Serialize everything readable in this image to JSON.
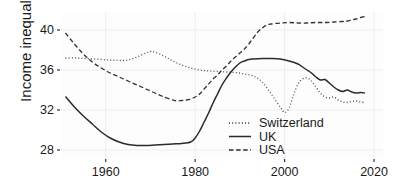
{
  "chart_data": {
    "type": "line",
    "title": "",
    "xlabel": "",
    "ylabel": "Income inequality",
    "xlim": [
      1950,
      2022
    ],
    "ylim": [
      27.2,
      41.8
    ],
    "xticks": [
      1960,
      1980,
      2000,
      2020
    ],
    "xticklabels": [
      "1960",
      "1980",
      "2000",
      "2020"
    ],
    "yticks": [
      28,
      32,
      36,
      40
    ],
    "yticklabels": [
      "28",
      "32",
      "36",
      "40"
    ],
    "grid": true,
    "legend_position": "inside-bottom-right",
    "series": [
      {
        "name": "Switzerland",
        "style": "dotted",
        "color": "#4d4d4d",
        "points": [
          [
            1951,
            37.2
          ],
          [
            1953,
            37.2
          ],
          [
            1955,
            37.15
          ],
          [
            1957,
            37.1
          ],
          [
            1959,
            37.05
          ],
          [
            1961,
            37.0
          ],
          [
            1963,
            36.95
          ],
          [
            1965,
            37.0
          ],
          [
            1967,
            37.3
          ],
          [
            1969,
            37.7
          ],
          [
            1970,
            37.85
          ],
          [
            1971,
            37.8
          ],
          [
            1973,
            37.4
          ],
          [
            1975,
            36.9
          ],
          [
            1977,
            36.5
          ],
          [
            1979,
            36.2
          ],
          [
            1981,
            36.0
          ],
          [
            1983,
            35.9
          ],
          [
            1985,
            35.85
          ],
          [
            1987,
            35.8
          ],
          [
            1989,
            35.75
          ],
          [
            1991,
            35.6
          ],
          [
            1993,
            35.4
          ],
          [
            1995,
            34.8
          ],
          [
            1997,
            33.6
          ],
          [
            1999,
            32.3
          ],
          [
            2000,
            31.75
          ],
          [
            2001,
            32.2
          ],
          [
            2002,
            33.5
          ],
          [
            2003,
            34.6
          ],
          [
            2004,
            35.1
          ],
          [
            2005,
            35.2
          ],
          [
            2006,
            34.9
          ],
          [
            2007,
            34.3
          ],
          [
            2008,
            33.7
          ],
          [
            2009,
            33.3
          ],
          [
            2010,
            33.2
          ],
          [
            2011,
            33.3
          ],
          [
            2012,
            33.0
          ],
          [
            2013,
            32.8
          ],
          [
            2014,
            32.75
          ],
          [
            2015,
            32.85
          ],
          [
            2016,
            32.9
          ],
          [
            2017,
            32.8
          ],
          [
            2018,
            32.75
          ]
        ]
      },
      {
        "name": "UK",
        "style": "solid",
        "color": "#2b2b2b",
        "points": [
          [
            1951,
            33.35
          ],
          [
            1953,
            32.3
          ],
          [
            1955,
            31.4
          ],
          [
            1957,
            30.6
          ],
          [
            1959,
            29.8
          ],
          [
            1961,
            29.2
          ],
          [
            1963,
            28.8
          ],
          [
            1965,
            28.55
          ],
          [
            1967,
            28.45
          ],
          [
            1969,
            28.45
          ],
          [
            1971,
            28.5
          ],
          [
            1973,
            28.55
          ],
          [
            1975,
            28.6
          ],
          [
            1977,
            28.65
          ],
          [
            1979,
            28.8
          ],
          [
            1980,
            29.2
          ],
          [
            1981,
            29.9
          ],
          [
            1982,
            30.8
          ],
          [
            1983,
            31.7
          ],
          [
            1984,
            32.7
          ],
          [
            1985,
            33.6
          ],
          [
            1986,
            34.5
          ],
          [
            1987,
            35.2
          ],
          [
            1988,
            35.8
          ],
          [
            1989,
            36.3
          ],
          [
            1990,
            36.7
          ],
          [
            1991,
            36.9
          ],
          [
            1992,
            37.05
          ],
          [
            1993,
            37.1
          ],
          [
            1995,
            37.15
          ],
          [
            1997,
            37.15
          ],
          [
            1999,
            37.1
          ],
          [
            2001,
            36.9
          ],
          [
            2003,
            36.6
          ],
          [
            2004,
            36.3
          ],
          [
            2005,
            36.0
          ],
          [
            2006,
            35.7
          ],
          [
            2007,
            35.3
          ],
          [
            2008,
            35.0
          ],
          [
            2009,
            35.05
          ],
          [
            2010,
            34.7
          ],
          [
            2011,
            34.3
          ],
          [
            2012,
            34.0
          ],
          [
            2013,
            33.85
          ],
          [
            2014,
            34.0
          ],
          [
            2015,
            33.8
          ],
          [
            2016,
            33.7
          ],
          [
            2017,
            33.75
          ],
          [
            2018,
            33.7
          ]
        ]
      },
      {
        "name": "USA",
        "style": "dashed",
        "color": "#333333",
        "points": [
          [
            1951,
            39.7
          ],
          [
            1953,
            38.6
          ],
          [
            1955,
            37.6
          ],
          [
            1957,
            36.8
          ],
          [
            1959,
            36.2
          ],
          [
            1961,
            35.7
          ],
          [
            1963,
            35.3
          ],
          [
            1965,
            34.9
          ],
          [
            1967,
            34.5
          ],
          [
            1969,
            34.1
          ],
          [
            1971,
            33.7
          ],
          [
            1973,
            33.3
          ],
          [
            1975,
            33.0
          ],
          [
            1976,
            32.9
          ],
          [
            1977,
            32.95
          ],
          [
            1978,
            33.0
          ],
          [
            1979,
            33.1
          ],
          [
            1980,
            33.3
          ],
          [
            1981,
            33.6
          ],
          [
            1982,
            34.1
          ],
          [
            1983,
            34.6
          ],
          [
            1984,
            35.1
          ],
          [
            1985,
            35.5
          ],
          [
            1986,
            36.0
          ],
          [
            1987,
            36.4
          ],
          [
            1988,
            36.9
          ],
          [
            1989,
            37.3
          ],
          [
            1990,
            37.7
          ],
          [
            1991,
            38.1
          ],
          [
            1992,
            38.6
          ],
          [
            1993,
            39.2
          ],
          [
            1994,
            39.8
          ],
          [
            1995,
            40.2
          ],
          [
            1996,
            40.5
          ],
          [
            1997,
            40.6
          ],
          [
            1999,
            40.7
          ],
          [
            2001,
            40.75
          ],
          [
            2003,
            40.7
          ],
          [
            2005,
            40.7
          ],
          [
            2007,
            40.75
          ],
          [
            2009,
            40.75
          ],
          [
            2011,
            40.8
          ],
          [
            2013,
            40.85
          ],
          [
            2014,
            40.9
          ],
          [
            2015,
            41.0
          ],
          [
            2016,
            41.1
          ],
          [
            2017,
            41.25
          ],
          [
            2018,
            41.35
          ]
        ]
      }
    ]
  },
  "legend": {
    "items": [
      {
        "label": "Switzerland",
        "style": "dotted"
      },
      {
        "label": "UK",
        "style": "solid"
      },
      {
        "label": "USA",
        "style": "dashed"
      }
    ]
  },
  "axes": {
    "y_title": "Income inequality"
  }
}
